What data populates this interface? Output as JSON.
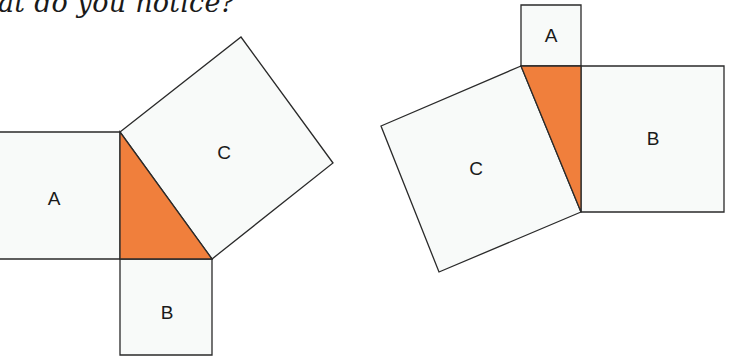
{
  "caption": "at do you notice?",
  "colors": {
    "triangle": "#f07f3c",
    "square_fill": "#f8faf9",
    "stroke": "#2a2a2a"
  },
  "figures": [
    {
      "name": "left-figure",
      "triangle": [
        [
          120,
          132
        ],
        [
          120,
          259
        ],
        [
          212,
          259
        ]
      ],
      "squares": [
        {
          "label": "A",
          "points": [
            [
              -2,
              132
            ],
            [
              120,
              132
            ],
            [
              120,
              259
            ],
            [
              -2,
              259
            ]
          ],
          "label_pos": [
            54,
            198
          ]
        },
        {
          "label": "B",
          "points": [
            [
              120,
              259
            ],
            [
              212,
              259
            ],
            [
              212,
              355
            ],
            [
              120,
              355
            ]
          ],
          "label_pos": [
            167,
            312
          ]
        },
        {
          "label": "C",
          "points": [
            [
              120,
              132
            ],
            [
              241,
              37
            ],
            [
              333,
              163
            ],
            [
              212,
              259
            ]
          ],
          "label_pos": [
            224,
            152
          ]
        }
      ]
    },
    {
      "name": "right-figure",
      "triangle": [
        [
          521,
          66
        ],
        [
          581,
          66
        ],
        [
          581,
          212
        ]
      ],
      "squares": [
        {
          "label": "A",
          "points": [
            [
              521,
              5
            ],
            [
              581,
              5
            ],
            [
              581,
              66
            ],
            [
              521,
              66
            ]
          ],
          "label_pos": [
            551,
            35
          ]
        },
        {
          "label": "B",
          "points": [
            [
              581,
              66
            ],
            [
              724,
              66
            ],
            [
              724,
              212
            ],
            [
              581,
              212
            ]
          ],
          "label_pos": [
            653,
            138
          ]
        },
        {
          "label": "C",
          "points": [
            [
              521,
              66
            ],
            [
              381,
              126
            ],
            [
              439,
              272
            ],
            [
              581,
              212
            ]
          ],
          "label_pos": [
            476,
            168
          ]
        }
      ]
    }
  ]
}
